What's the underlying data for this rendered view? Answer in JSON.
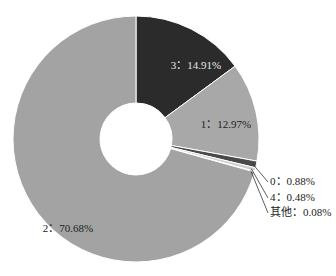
{
  "chart_data": {
    "type": "pie",
    "variant": "donut",
    "title": "",
    "start_angle_deg": 0,
    "direction": "clockwise",
    "slices": [
      {
        "label": "3",
        "value": 14.91,
        "display": "3：14.91%",
        "color": "#2b2b2b",
        "label_color": "#e6e6e6",
        "label_pos": "inside"
      },
      {
        "label": "1",
        "value": 12.97,
        "display": "1：12.97%",
        "color": "#a8a8a8",
        "label_color": "#222222",
        "label_pos": "inside"
      },
      {
        "label": "0",
        "value": 0.88,
        "display": "0：0.88%",
        "color": "#4a4a4a",
        "label_color": "#222222",
        "label_pos": "outside"
      },
      {
        "label": "4",
        "value": 0.48,
        "display": "4：0.48%",
        "color": "#cfcfcf",
        "label_color": "#222222",
        "label_pos": "outside"
      },
      {
        "label": "其他",
        "value": 0.08,
        "display": "其他：0.08%",
        "color": "#bdbdbd",
        "label_color": "#222222",
        "label_pos": "outside"
      },
      {
        "label": "2",
        "value": 70.68,
        "display": "2：70.68%",
        "color": "#a3a3a3",
        "label_color": "#222222",
        "label_pos": "inside"
      }
    ],
    "legend": null
  }
}
